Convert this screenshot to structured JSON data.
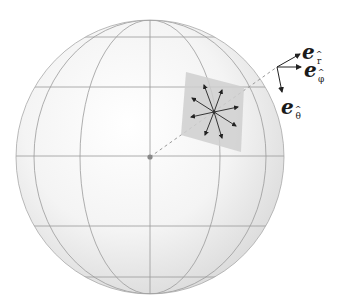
{
  "figure": {
    "colors": {
      "background": "#ffffff",
      "sphere_fill": "#f2f2f2",
      "grid_line": "#9a9a9a",
      "tangent_plane": "#cfcfcf",
      "arrow": "#222222",
      "dashed_line": "#9a9a9a",
      "center_dot": "#888888"
    }
  },
  "labels": {
    "e_r": {
      "base": "e",
      "sub": "r",
      "hat": "^"
    },
    "e_phi": {
      "base": "e",
      "sub": "φ",
      "hat": "^"
    },
    "e_theta": {
      "base": "e",
      "sub": "θ",
      "hat": "^"
    }
  }
}
